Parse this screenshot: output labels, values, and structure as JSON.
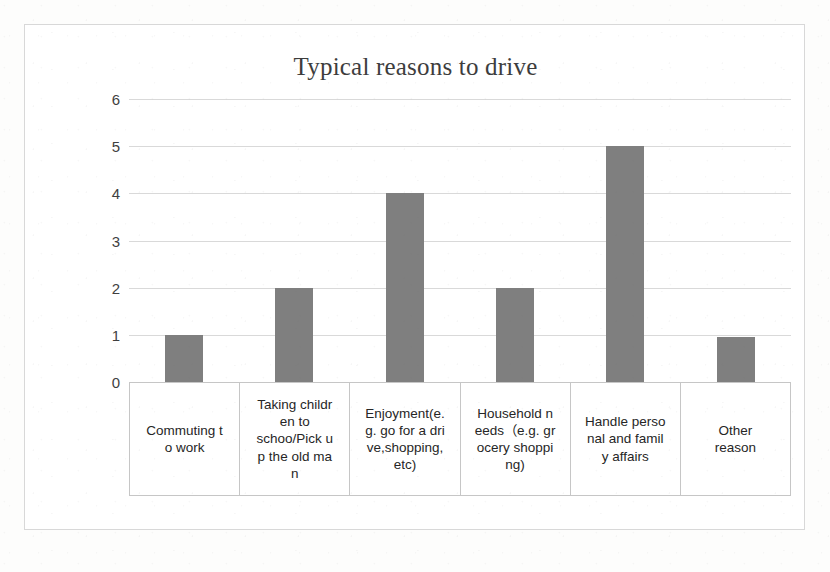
{
  "chart_data": {
    "type": "bar",
    "title": "Typical reasons to drive",
    "xlabel": "",
    "ylabel": "",
    "ylim": [
      0,
      6
    ],
    "ytick_labels": [
      "6",
      "5",
      "4",
      "3",
      "2",
      "1",
      "0"
    ],
    "ytick_values": [
      6,
      5,
      4,
      3,
      2,
      1,
      0
    ],
    "grid": true,
    "legend": false,
    "bar_color": "#7f7f7f",
    "categories": [
      "Commuting to work",
      "Taking children to schoo/Pick up the old man",
      "Enjoyment(e.g. go for a drive,shopping, etc)",
      "Household needs（e.g. grocery shopping)",
      "Handle personal and family affairs",
      "Other reason"
    ],
    "category_display": [
      "Commuting t\no work",
      "Taking childr\nen to\nschoo/Pick u\np the old ma\nn",
      "Enjoyment(e.\ng. go for a dri\nve,shopping,\netc)",
      "Household n\needs（e.g. gr\nocery shoppi\nng)",
      "Handle perso\nnal and famil\ny affairs",
      "Other\nreason"
    ],
    "values": [
      1,
      2,
      4,
      2,
      5,
      0.95
    ]
  }
}
